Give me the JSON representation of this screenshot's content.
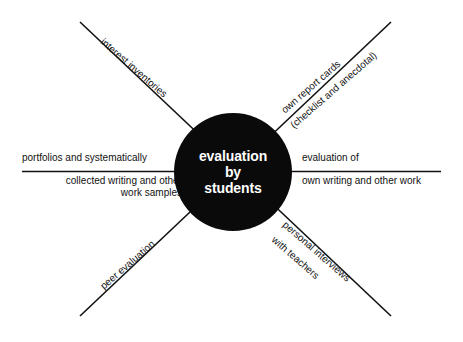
{
  "diagram": {
    "type": "concept-map",
    "hub": {
      "lines": [
        "evaluation",
        "by",
        "students"
      ],
      "shape": "circle",
      "fill_color": "#0a0a0a",
      "text_color": "#ffffff"
    },
    "line_color": "#111111",
    "background_color": "#ffffff",
    "branches": {
      "upper_left": {
        "direction": "upper-left",
        "label": "interest inventories"
      },
      "upper_right": {
        "direction": "upper-right",
        "label_line1": "own report cards",
        "label_line2": "(checklist and anecdotal)"
      },
      "left": {
        "direction": "left",
        "above_line": "portfolios and systematically",
        "below_line_1": "collected writing and other",
        "below_line_2": "work samples"
      },
      "right": {
        "direction": "right",
        "above_line": "evaluation of",
        "below_line": "own writing and other work"
      },
      "lower_left": {
        "direction": "lower-left",
        "label": "peer evaluation"
      },
      "lower_right": {
        "direction": "lower-right",
        "label_line1": "personal interviews",
        "label_line2": "with teachers"
      }
    }
  }
}
